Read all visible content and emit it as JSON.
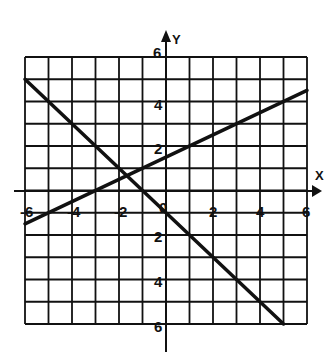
{
  "chart_data": {
    "type": "line",
    "title": "",
    "xlabel": "X",
    "ylabel": "Y",
    "xlim": [
      -6,
      6
    ],
    "ylim": [
      -6,
      6
    ],
    "grid": true,
    "grid_step": 1,
    "x_ticks": [
      -6,
      -4,
      -2,
      0,
      2,
      4,
      6
    ],
    "x_tick_labels": [
      "-6",
      "-4",
      "-2",
      "0",
      "2",
      "4",
      "6"
    ],
    "y_ticks": [
      6,
      4,
      2,
      -2,
      -4,
      -6
    ],
    "y_tick_labels": [
      "6",
      "4",
      "2",
      "2",
      "4",
      "6"
    ],
    "series": [
      {
        "name": "line-rising",
        "equation": "y = 0.5x + 1.5",
        "x": [
          -6,
          6
        ],
        "y": [
          -1.5,
          4.5
        ]
      },
      {
        "name": "line-falling",
        "equation": "y = -x - 1",
        "x": [
          -6,
          5
        ],
        "y": [
          5,
          -6
        ]
      }
    ],
    "intersection": {
      "x": -1.67,
      "y": 0.67
    }
  },
  "labels": {
    "x_axis": "X",
    "y_axis": "Y"
  },
  "colors": {
    "ink": "#111111",
    "background": "#ffffff"
  }
}
